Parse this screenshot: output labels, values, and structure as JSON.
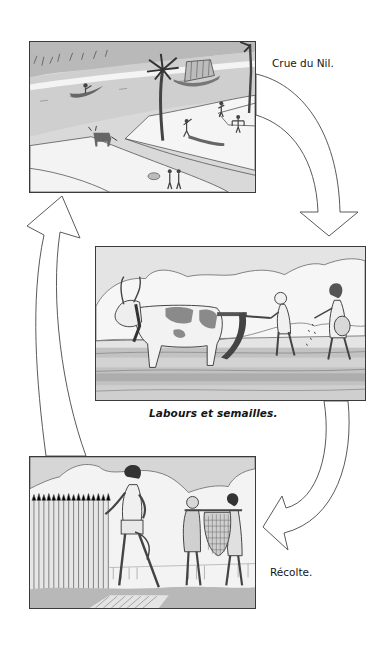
{
  "diagram": {
    "type": "cycle",
    "stages": [
      {
        "id": "flood",
        "caption": "Crue du Nil.",
        "scene": "Nile flood: river with sailboat and small boats, palm trees, flooded fields with workers, cow, people carrying water yokes"
      },
      {
        "id": "plough",
        "caption": "Labours et semailles.",
        "scene": "Ploughing and sowing: spotted ox pulling wooden plough, bald ploughman, woman sowing seeds from a bag"
      },
      {
        "id": "harvest",
        "caption": "Récolte.",
        "scene": "Harvest: man cutting wheat with sickle, two men carrying a woven basket on a pole"
      }
    ],
    "arrows": [
      {
        "from": "flood",
        "to": "plough",
        "style": "hollow-curved",
        "direction": "down"
      },
      {
        "from": "plough",
        "to": "harvest",
        "style": "hollow-curved",
        "direction": "down-left"
      },
      {
        "from": "harvest",
        "to": "flood",
        "style": "hollow-curved",
        "direction": "up"
      }
    ]
  },
  "colors": {
    "ink": "#3a3a3a",
    "paper": "#ffffff",
    "shade_light": "#e2e2e2",
    "shade_mid": "#bdbdbd",
    "shade_dark": "#8f8f8f"
  }
}
